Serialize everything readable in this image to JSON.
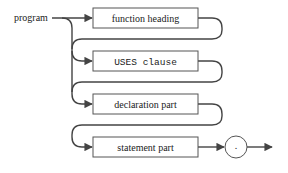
{
  "diagram": {
    "type": "syntax-diagram",
    "start_label": "program",
    "boxes": [
      {
        "label": "function heading",
        "optional": true
      },
      {
        "label": "USES clause",
        "optional": true
      },
      {
        "label": "declaration part",
        "optional": true
      },
      {
        "label": "statement part",
        "optional": false
      }
    ],
    "terminal": {
      "symbol": "."
    },
    "colors": {
      "line": "#444444",
      "box_border": "#555555",
      "background": "#ffffff"
    }
  }
}
